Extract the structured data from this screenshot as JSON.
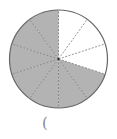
{
  "diagram": {
    "type": "fraction-circle",
    "total_parts": 10,
    "shaded_parts": 7,
    "unshaded_parts": 3,
    "shaded_color": "#b3b3b3",
    "unshaded_color": "#ffffff",
    "border_color": "#666666",
    "divider_color": "#777777",
    "center": [
      58.5,
      59
    ],
    "radius": 49,
    "unshaded_start_deg": 0,
    "unshaded_end_deg": 108
  },
  "answer_blank": {
    "text": "("
  }
}
